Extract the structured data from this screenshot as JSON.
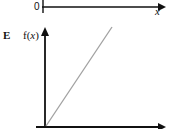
{
  "top_axis": {
    "origin_label": "0",
    "x_label": "x"
  },
  "graph": {
    "option_label": "E",
    "y_label_prefix": "f(",
    "y_label_var": "x",
    "y_label_suffix": ")",
    "line_color": "#a0a0a0",
    "axis_color": "#111111",
    "description": "straight line through origin with positive slope"
  }
}
